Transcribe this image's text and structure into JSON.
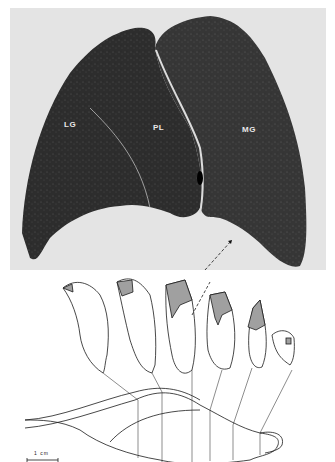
{
  "figure": {
    "photo": {
      "description": "Transverse section of tissue, dark stained halves",
      "labels": [
        {
          "id": "LG",
          "text": "LG"
        },
        {
          "id": "PL",
          "text": "PL"
        },
        {
          "id": "MG",
          "text": "MG"
        }
      ]
    },
    "drawing": {
      "section_count": 6,
      "scale_bar": {
        "label": "1 cm"
      },
      "colors": {
        "shaded": "#a0a0a0",
        "line": "#1a1a1a"
      }
    }
  }
}
